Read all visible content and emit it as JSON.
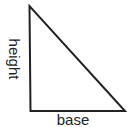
{
  "diagram": {
    "type": "right-triangle",
    "labels": {
      "height": "height",
      "base": "base"
    },
    "colors": {
      "stroke": "#222222",
      "background": "#ffffff"
    }
  }
}
